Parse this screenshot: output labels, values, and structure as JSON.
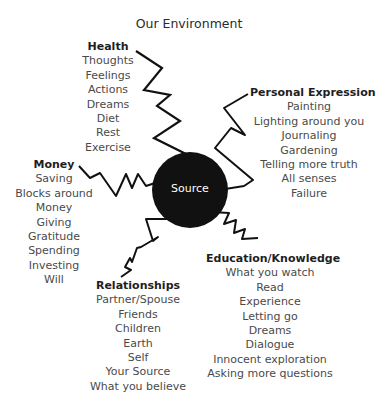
{
  "title": "Our Environment",
  "center": {
    "label": "Source",
    "color": "#111111"
  },
  "groups": {
    "health": {
      "label": "Health",
      "items": [
        "Thoughts",
        "Feelings",
        "Actions",
        "Dreams",
        "Diet",
        "Rest",
        "Exercise"
      ]
    },
    "personal_expression": {
      "label": "Personal Expression",
      "items": [
        "Painting",
        "Lighting around you",
        "Journaling",
        "Gardening",
        "Telling more truth",
        "All senses",
        "Failure"
      ]
    },
    "money": {
      "label": "Money",
      "items": [
        "Saving",
        "Blocks around",
        "Money",
        "Giving",
        "Gratitude",
        "Spending",
        "Investing",
        "Will"
      ]
    },
    "relationships": {
      "label": "Relationships",
      "items": [
        "Partner/Spouse",
        "Friends",
        "Children",
        "Earth",
        "Self",
        "Your Source",
        "What you believe"
      ]
    },
    "education": {
      "label": "Education/Knowledge",
      "items": [
        "What you watch",
        "Read",
        "Experience",
        "Letting go",
        "Dreams",
        "Dialogue",
        "Innocent exploration",
        "Asking more questions"
      ]
    }
  }
}
